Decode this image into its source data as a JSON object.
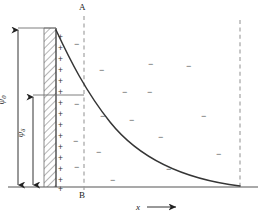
{
  "figure": {
    "type": "electric-double-layer-potential-decay",
    "title": "",
    "labels": {
      "surface_potential": "ψ",
      "surface_potential_sub": "0",
      "stern_potential": "ψ",
      "stern_potential_sub": "δ",
      "plane_top": "A",
      "plane_bottom": "B",
      "x_axis": "x",
      "x_axis_arrow": "→"
    },
    "glyphs": {
      "plus": "+",
      "minus": "−"
    },
    "colors": {
      "curve": "#333333",
      "axis": "#888888",
      "dashed": "#9a9a9a",
      "hatch": "#555555",
      "text": "#1a1a1a",
      "sign": "#555555"
    }
  },
  "chart_data": {
    "type": "line",
    "title": "",
    "xlabel": "x",
    "ylabel": "ψ",
    "grid": false,
    "legend": null,
    "annotations": [
      {
        "text": "A",
        "role": "stern-plane-top-label"
      },
      {
        "text": "B",
        "role": "stern-plane-bottom-label"
      },
      {
        "text": "ψ0",
        "role": "surface-potential-measure"
      },
      {
        "text": "ψδ",
        "role": "stern-potential-measure"
      }
    ],
    "series": [
      {
        "name": "potential decay",
        "x": [
          0,
          6,
          12,
          18,
          24,
          30,
          36,
          42,
          48,
          54,
          60,
          66,
          72,
          78,
          84,
          90,
          96,
          100
        ],
        "y": [
          1.0,
          0.86,
          0.745,
          0.645,
          0.558,
          0.483,
          0.418,
          0.362,
          0.313,
          0.271,
          0.235,
          0.203,
          0.176,
          0.152,
          0.132,
          0.114,
          0.099,
          0.09
        ]
      }
    ],
    "xlim": [
      0,
      100
    ],
    "ylim": [
      0,
      1.0
    ]
  },
  "ions": {
    "plus_count": 15,
    "minus_count": 17,
    "plus_positions": [
      {
        "x": 58,
        "y": 33
      },
      {
        "x": 58,
        "y": 44
      },
      {
        "x": 58,
        "y": 55
      },
      {
        "x": 58,
        "y": 66
      },
      {
        "x": 58,
        "y": 77
      },
      {
        "x": 58,
        "y": 88
      },
      {
        "x": 58,
        "y": 99
      },
      {
        "x": 58,
        "y": 110
      },
      {
        "x": 58,
        "y": 121
      },
      {
        "x": 58,
        "y": 132
      },
      {
        "x": 58,
        "y": 143
      },
      {
        "x": 58,
        "y": 154
      },
      {
        "x": 58,
        "y": 165
      },
      {
        "x": 58,
        "y": 176
      },
      {
        "x": 58,
        "y": 185
      }
    ],
    "minus_positions": [
      {
        "x": 74,
        "y": 40
      },
      {
        "x": 99,
        "y": 66
      },
      {
        "x": 74,
        "y": 100
      },
      {
        "x": 147,
        "y": 88
      },
      {
        "x": 148,
        "y": 60
      },
      {
        "x": 73,
        "y": 137
      },
      {
        "x": 74,
        "y": 163
      },
      {
        "x": 96,
        "y": 148
      },
      {
        "x": 100,
        "y": 112
      },
      {
        "x": 129,
        "y": 116
      },
      {
        "x": 158,
        "y": 133
      },
      {
        "x": 201,
        "y": 112
      },
      {
        "x": 166,
        "y": 165
      },
      {
        "x": 110,
        "y": 176
      },
      {
        "x": 216,
        "y": 150
      },
      {
        "x": 186,
        "y": 62
      },
      {
        "x": 122,
        "y": 88
      }
    ]
  }
}
